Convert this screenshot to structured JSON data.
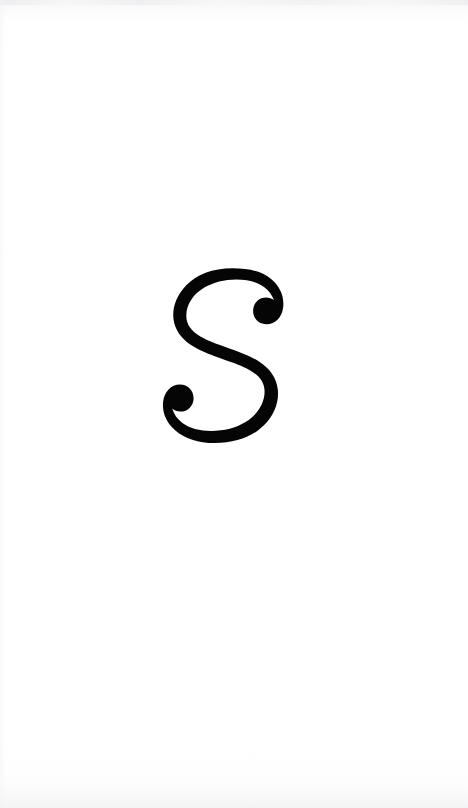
{
  "page": {
    "width": 468,
    "height": 808,
    "background_color": "#ffffff",
    "paper_tone_color": "#f4f4f6",
    "orientation": "portrait",
    "kind": "scanned-letter-specimen"
  },
  "glyph": {
    "character": "S",
    "name": "letter-s",
    "label": "S",
    "color": "#050505",
    "style": "serif-with-ball-terminals",
    "case": "uppercase",
    "bounds": {
      "left": 166,
      "top": 268,
      "right": 288,
      "bottom": 448,
      "width": 122,
      "height": 180
    },
    "center_x": 227,
    "center_y": 358
  },
  "artifacts": {
    "top_edge_streak_color": "#ececee",
    "bottom_edge_streak_color": "#f0f0f2",
    "left_edge_streak_color": "#f3f3f5"
  }
}
